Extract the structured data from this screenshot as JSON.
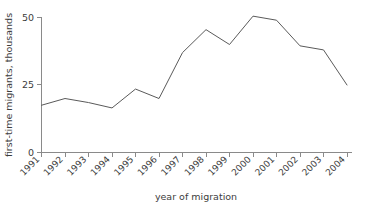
{
  "chart_data": {
    "type": "line",
    "title": "",
    "xlabel": "year of migration",
    "ylabel": "first-time migrants, thousands",
    "categories": [
      "1991",
      "1992",
      "1993",
      "1994",
      "1995",
      "1996",
      "1997",
      "1998",
      "1999",
      "2000",
      "2001",
      "2002",
      "2003",
      "2004"
    ],
    "values": [
      17.5,
      20,
      18.5,
      16.5,
      23.5,
      20,
      37,
      45.5,
      40,
      50.5,
      49,
      39.5,
      38,
      25
    ],
    "series": [
      {
        "name": "first-time migrants",
        "values": [
          17.5,
          20,
          18.5,
          16.5,
          23.5,
          20,
          37,
          45.5,
          40,
          50.5,
          49,
          39.5,
          38,
          25
        ]
      }
    ],
    "ylim": [
      0,
      50
    ],
    "yticks": [
      0,
      25,
      50
    ],
    "ytick_labels": [
      "0",
      "25",
      "50"
    ],
    "xlim": [
      "1991",
      "2004"
    ],
    "grid": false,
    "legend": false,
    "line_color": "#5a5a5a",
    "axis_color": "#8a8a8a",
    "background": "#ffffff"
  },
  "axes": {
    "y_axis_title": "first-time migrants, thousands",
    "x_axis_title": "year of migration",
    "y_ticks": [
      {
        "label": "50",
        "value": 50
      },
      {
        "label": "25",
        "value": 25
      },
      {
        "label": "0",
        "value": 0
      }
    ],
    "x_ticks": [
      {
        "label": "1991"
      },
      {
        "label": "1992"
      },
      {
        "label": "1993"
      },
      {
        "label": "1994"
      },
      {
        "label": "1995"
      },
      {
        "label": "1996"
      },
      {
        "label": "1997"
      },
      {
        "label": "1998"
      },
      {
        "label": "1999"
      },
      {
        "label": "2000"
      },
      {
        "label": "2001"
      },
      {
        "label": "2002"
      },
      {
        "label": "2003"
      },
      {
        "label": "2004"
      }
    ]
  }
}
